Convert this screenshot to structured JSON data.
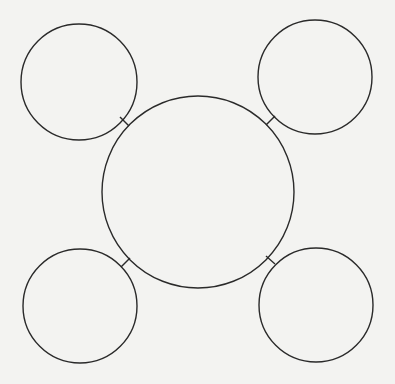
{
  "diagram": {
    "type": "web-organizer",
    "background": "#f3f3f1",
    "stroke": "#2a2a2a",
    "center": {
      "cx": 198,
      "cy": 192,
      "r": 96,
      "label": ""
    },
    "satellites": [
      {
        "id": "top-left",
        "cx": 79,
        "cy": 82,
        "r": 58,
        "label": ""
      },
      {
        "id": "top-right",
        "cx": 315,
        "cy": 77,
        "r": 57,
        "label": ""
      },
      {
        "id": "bottom-left",
        "cx": 80,
        "cy": 306,
        "r": 57,
        "label": ""
      },
      {
        "id": "bottom-right",
        "cx": 316,
        "cy": 305,
        "r": 57,
        "label": ""
      }
    ],
    "connectors": [
      {
        "id": "top-left",
        "x1": 120,
        "y1": 117,
        "x2": 129,
        "y2": 126
      },
      {
        "id": "top-right",
        "x1": 275,
        "y1": 116,
        "x2": 266,
        "y2": 125
      },
      {
        "id": "bottom-left",
        "x1": 130,
        "y1": 258,
        "x2": 121,
        "y2": 267
      },
      {
        "id": "bottom-right",
        "x1": 266,
        "y1": 256,
        "x2": 275,
        "y2": 264
      }
    ]
  }
}
